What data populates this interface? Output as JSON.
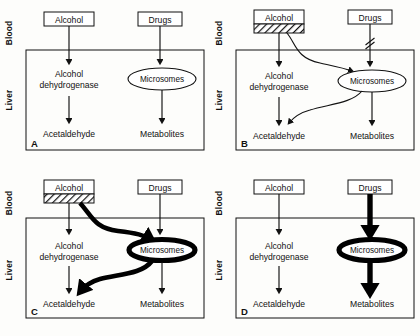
{
  "figure": {
    "type": "diagram",
    "axis_labels": {
      "blood": "Blood",
      "liver": "Liver"
    },
    "nodes": {
      "alcohol": "Alcohol",
      "drugs": "Drugs",
      "alcohol_dehydrogenase_line1": "Alcohol",
      "alcohol_dehydrogenase_line2": "dehydrogenase",
      "microsomes": "Microsomes",
      "acetaldehyde": "Acetaldehyde",
      "metabolites": "Metabolites"
    },
    "colors": {
      "ink": "#111111",
      "bold_ink": "#000000",
      "paper": "#fdfdfb",
      "box_fill": "#ffffff"
    },
    "panels": [
      {
        "letter": "A",
        "caption": "Normal state: alcohol metabolised by alcohol dehydrogenase to acetaldehyde; drugs metabolised by microsomes to metabolites. All arrows thin; no interaction.",
        "alcohol_hatched": false,
        "drugs_blocked": false,
        "alcohol_to_microsomes_curve": false,
        "microsomes_to_acetaldehyde_curve": false,
        "bold_microsomes": false,
        "bold_drug_path": false
      },
      {
        "letter": "B",
        "caption": "Acute alcohol intake (hatched band under Alcohol): alcohol is diverted to microsomes and competes there, so drug metabolism is blocked (slash on drug arrow).",
        "alcohol_hatched": true,
        "drugs_blocked": true,
        "alcohol_to_microsomes_curve": true,
        "microsomes_to_acetaldehyde_curve": true,
        "bold_microsomes": false,
        "bold_drug_path": false
      },
      {
        "letter": "C",
        "caption": "Chronic alcohol intake (hatched band under Alcohol): microsomal system induced (bold ellipse); heavy alcohol flux through microsomes back to acetaldehyde.",
        "alcohol_hatched": true,
        "drugs_blocked": false,
        "alcohol_to_microsomes_curve": true,
        "microsomes_to_acetaldehyde_curve": true,
        "bold_microsomes": true,
        "bold_drug_path": false
      },
      {
        "letter": "D",
        "caption": "After alcohol withdrawal: induced microsomes (bold ellipse) accelerate drug metabolism; thick arrows from Drugs through Microsomes to Metabolites.",
        "alcohol_hatched": false,
        "drugs_blocked": false,
        "alcohol_to_microsomes_curve": false,
        "microsomes_to_acetaldehyde_curve": false,
        "bold_microsomes": true,
        "bold_drug_path": true
      }
    ]
  }
}
